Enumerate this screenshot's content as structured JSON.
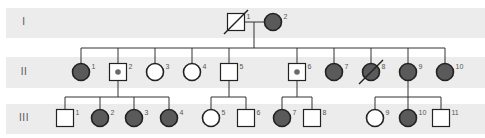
{
  "colors": {
    "affected_fill": "#5a5a5a",
    "unaffected_fill": "#ffffff",
    "stroke": "#222222",
    "band": "#ececec",
    "carrier_dot": "#6a6a6a"
  },
  "generations": [
    {
      "label": "I",
      "band_top": 8,
      "band_height": 30,
      "y": 22
    },
    {
      "label": "II",
      "band_top": 57,
      "band_height": 31,
      "y": 72
    },
    {
      "label": "III",
      "band_top": 104,
      "band_height": 30,
      "y": 118
    }
  ],
  "individuals": [
    {
      "gen": 0,
      "num": "1",
      "x": 236,
      "sex": "male",
      "status": "unaffected",
      "deceased": true
    },
    {
      "gen": 0,
      "num": "2",
      "x": 273,
      "sex": "female",
      "status": "affected",
      "deceased": false
    },
    {
      "gen": 1,
      "num": "1",
      "x": 81,
      "sex": "female",
      "status": "affected",
      "deceased": false
    },
    {
      "gen": 1,
      "num": "2",
      "x": 118,
      "sex": "male",
      "status": "carrier",
      "deceased": false
    },
    {
      "gen": 1,
      "num": "3",
      "x": 155,
      "sex": "female",
      "status": "unaffected",
      "deceased": false
    },
    {
      "gen": 1,
      "num": "4",
      "x": 192,
      "sex": "female",
      "status": "unaffected",
      "deceased": false
    },
    {
      "gen": 1,
      "num": "5",
      "x": 229,
      "sex": "male",
      "status": "unaffected",
      "deceased": false
    },
    {
      "gen": 1,
      "num": "6",
      "x": 297,
      "sex": "male",
      "status": "carrier",
      "deceased": false
    },
    {
      "gen": 1,
      "num": "7",
      "x": 334,
      "sex": "female",
      "status": "affected",
      "deceased": false
    },
    {
      "gen": 1,
      "num": "8",
      "x": 371,
      "sex": "female",
      "status": "affected",
      "deceased": true
    },
    {
      "gen": 1,
      "num": "9",
      "x": 408,
      "sex": "female",
      "status": "affected",
      "deceased": false
    },
    {
      "gen": 1,
      "num": "10",
      "x": 445,
      "sex": "female",
      "status": "affected",
      "deceased": false
    },
    {
      "gen": 2,
      "num": "1",
      "x": 65,
      "sex": "male",
      "status": "unaffected",
      "deceased": false
    },
    {
      "gen": 2,
      "num": "2",
      "x": 100,
      "sex": "female",
      "status": "affected",
      "deceased": false
    },
    {
      "gen": 2,
      "num": "3",
      "x": 134,
      "sex": "female",
      "status": "affected",
      "deceased": false
    },
    {
      "gen": 2,
      "num": "4",
      "x": 169,
      "sex": "female",
      "status": "affected",
      "deceased": false
    },
    {
      "gen": 2,
      "num": "5",
      "x": 211,
      "sex": "female",
      "status": "unaffected",
      "deceased": false
    },
    {
      "gen": 2,
      "num": "6",
      "x": 246,
      "sex": "male",
      "status": "unaffected",
      "deceased": false
    },
    {
      "gen": 2,
      "num": "7",
      "x": 282,
      "sex": "female",
      "status": "affected",
      "deceased": false
    },
    {
      "gen": 2,
      "num": "8",
      "x": 312,
      "sex": "male",
      "status": "unaffected",
      "deceased": false
    },
    {
      "gen": 2,
      "num": "9",
      "x": 375,
      "sex": "female",
      "status": "unaffected",
      "deceased": false
    },
    {
      "gen": 2,
      "num": "10",
      "x": 408,
      "sex": "female",
      "status": "affected",
      "deceased": false
    },
    {
      "gen": 2,
      "num": "11",
      "x": 441,
      "sex": "male",
      "status": "unaffected",
      "deceased": false
    }
  ],
  "sibships": [
    {
      "parent_x": 254,
      "parent_y": 22,
      "line_y": 48,
      "child_gen": 1,
      "children_x": [
        81,
        118,
        155,
        192,
        229,
        297,
        334,
        371,
        408,
        445
      ]
    },
    {
      "parent_x": 118,
      "parent_y": 81,
      "line_y": 97,
      "child_gen": 2,
      "children_x": [
        65,
        100,
        134,
        169
      ]
    },
    {
      "parent_x": 229,
      "parent_y": 81,
      "line_y": 97,
      "child_gen": 2,
      "children_x": [
        211,
        246
      ]
    },
    {
      "parent_x": 297,
      "parent_y": 81,
      "line_y": 97,
      "child_gen": 2,
      "children_x": [
        282,
        312
      ]
    },
    {
      "parent_x": 408,
      "parent_y": 81,
      "line_y": 97,
      "child_gen": 2,
      "children_x": [
        375,
        408,
        441
      ]
    }
  ],
  "marriages": [
    {
      "gen": 0,
      "x1": 245,
      "x2": 264
    }
  ]
}
